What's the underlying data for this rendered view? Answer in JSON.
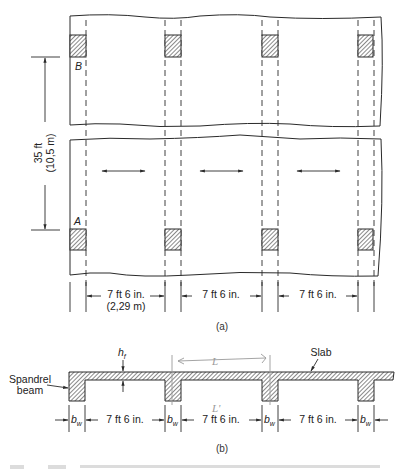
{
  "figure_a": {
    "label": "(a)",
    "column_labels": {
      "top_left": "B",
      "bottom_left": "A"
    },
    "vertical_dimension": {
      "imperial": "35 ft",
      "metric": "(10,5 m)"
    },
    "spacing_dimensions": [
      {
        "imperial": "7 ft 6 in.",
        "metric": "(2,29 m)"
      },
      {
        "imperial": "7 ft 6 in."
      },
      {
        "imperial": "7 ft 6 in."
      }
    ],
    "columns_per_row": 4,
    "span_direction_arrows": 3
  },
  "figure_b": {
    "label": "(b)",
    "slab_label": "Slab",
    "spandrel_label_line1": "Spandrel",
    "spandrel_label_line2": "beam",
    "flange_thickness_symbol": "h",
    "flange_thickness_subscript": "f",
    "web_width_symbol": "b",
    "web_width_subscript": "w",
    "clear_spacing": [
      "7 ft 6 in.",
      "7 ft 6 in.",
      "7 ft 6 in."
    ],
    "handwritten_annotations": [
      "L",
      "L'"
    ]
  },
  "colors": {
    "line": "#2a2a2a",
    "hatch": "#3a3a3a",
    "handwritten": "#9a9a9a"
  }
}
